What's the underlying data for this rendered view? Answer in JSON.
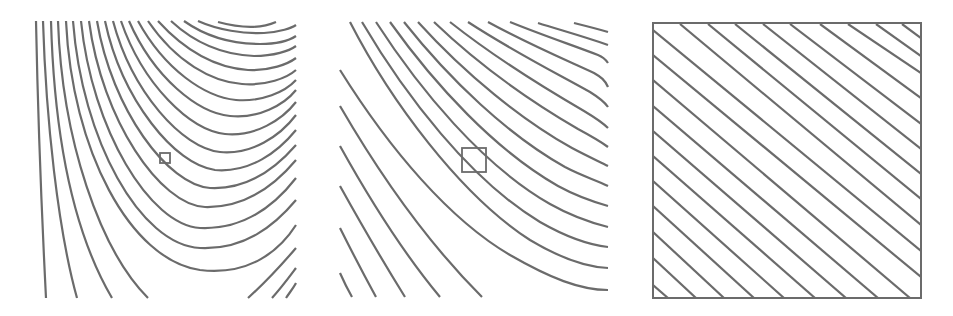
{
  "figure": {
    "line_color": "#6b6b6b",
    "background": "#ffffff",
    "panels": [
      {
        "id": "panel-1",
        "label": "",
        "contour_count": 22,
        "zoom_box": {
          "x": 160,
          "y": 153,
          "w": 10,
          "h": 10
        }
      },
      {
        "id": "panel-2",
        "label": "",
        "contour_count": 17,
        "zoom_box": {
          "x": 462,
          "y": 148,
          "w": 24,
          "h": 24
        }
      },
      {
        "id": "panel-3",
        "label": "",
        "contour_count": 14,
        "framed": true,
        "frame": {
          "x": 653,
          "y": 23,
          "w": 268,
          "h": 275
        }
      }
    ]
  }
}
